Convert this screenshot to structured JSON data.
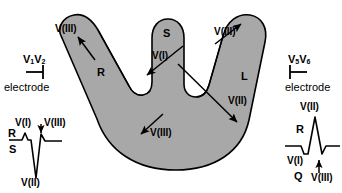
{
  "figure": {
    "heart": {
      "fill_color": "#a8a8a8",
      "outline_color": "#000000",
      "regions": [
        {
          "id": "R",
          "label": "R",
          "meaning": "right-ventricle-free-wall"
        },
        {
          "id": "S",
          "label": "S",
          "meaning": "interventricular-septum"
        },
        {
          "id": "L",
          "label": "L",
          "meaning": "left-ventricle-free-wall"
        }
      ]
    },
    "vectors": [
      {
        "id": "v3-right-wall",
        "label": "V(III)"
      },
      {
        "id": "v1-septum",
        "label": "V(I)"
      },
      {
        "id": "v3-apex",
        "label": "V(III)"
      },
      {
        "id": "v3-left-wall",
        "label": "V(III)"
      },
      {
        "id": "v2-left-wall",
        "label": "V(II)"
      }
    ],
    "electrodes": [
      {
        "id": "right-precordial",
        "lead1": "V",
        "sub1": "1",
        "lead2": "V",
        "sub2": "2",
        "caption": "electrode",
        "side": "left"
      },
      {
        "id": "left-precordial",
        "lead1": "V",
        "sub1": "5",
        "lead2": "V",
        "sub2": "6",
        "caption": "electrode",
        "side": "right"
      }
    ],
    "ecg_left": {
      "id": "v1-v2-complex",
      "morphology": "rS",
      "labels": {
        "r_wave": "R",
        "s_wave": "S",
        "v1": "V(I)",
        "v2": "V(II)",
        "v3": "V(III)"
      }
    },
    "ecg_right": {
      "id": "v5-v6-complex",
      "morphology": "qR",
      "labels": {
        "r_wave": "R",
        "q_wave": "Q",
        "v1": "V(I)",
        "v2": "V(II)",
        "v3": "V(III)"
      }
    }
  }
}
